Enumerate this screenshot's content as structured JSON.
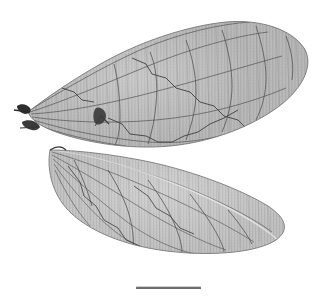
{
  "figure": {
    "background_color": "#ffffff",
    "membrane_color": "#b4b4b4",
    "membrane_color_light": "#c6c6c6",
    "membrane_color_dark": "#9a9a9a",
    "vein_color": "#555555",
    "vein_color_dark": "#333333",
    "crossvein_color": "#8a8a8a",
    "margin_color": "#6e6e6e",
    "base_color": "#2b2b2b",
    "scalebar_color": "#6b6b6b"
  },
  "specimens": [
    {
      "id": "forewing",
      "label": "forewing",
      "orientation": "oblique, base at left, apex upper right",
      "base_point": [
        28,
        112
      ],
      "apex_point": [
        306,
        58
      ],
      "longitudinal_vein_count": 7,
      "crossvein_rows": 26
    },
    {
      "id": "hindwing",
      "label": "hindwing",
      "orientation": "oblique, base at upper left, apex lower right",
      "base_point": [
        50,
        150
      ],
      "apex_point": [
        288,
        222
      ],
      "longitudinal_vein_count": 6,
      "crossvein_rows": 22
    }
  ],
  "scalebar": {
    "name": "scale-bar",
    "x_start": 136,
    "x_end": 201,
    "y": 288,
    "thickness_px": 2,
    "label": ""
  },
  "annotations": {
    "wing_base_stub_upper": [
      26,
      108
    ],
    "wing_base_stub_lower": [
      32,
      126
    ],
    "dark_vein_node": [
      101,
      116
    ]
  }
}
